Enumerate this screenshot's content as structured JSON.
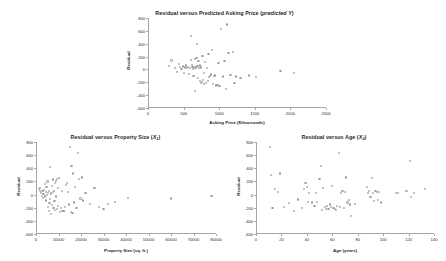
{
  "page": {
    "background": "#ffffff",
    "marker_color": "#9a9a9a",
    "axis_color": "#a6a6a6"
  },
  "charts": {
    "top": {
      "title_main": "Residual versus Predicted Asking Price (",
      "title_italic": "predicted Y",
      "title_close": ")",
      "xlabel": "Asking Price ($thousands)",
      "ylabel": "Residual",
      "xticks": [
        "0",
        "500",
        "1000",
        "1500",
        "2000",
        "2500"
      ],
      "yticks": [
        "800",
        "600",
        "400",
        "200",
        "0",
        "-200",
        "-400",
        "-600"
      ]
    },
    "bottom_left": {
      "title_pre": "Residual versus Property Size (",
      "title_var": "X",
      "title_sub": "1",
      "title_post": ")",
      "xlabel": "Property Size (sq. ft.)",
      "ylabel": "Residual",
      "xticks": [
        "0",
        "10000",
        "20000",
        "30000",
        "40000",
        "50000",
        "60000",
        "70000",
        "80000"
      ],
      "yticks": [
        "800",
        "600",
        "400",
        "200",
        "0",
        "-200",
        "-400",
        "-600"
      ]
    },
    "bottom_right": {
      "title_pre": "Residual versus Age (",
      "title_var": "X",
      "title_sub": "2",
      "title_post": ")",
      "xlabel": "Age (years)",
      "ylabel": "Residual",
      "xticks": [
        "0",
        "20",
        "40",
        "60",
        "80",
        "100",
        "120",
        "140"
      ],
      "yticks": [
        "800",
        "600",
        "400",
        "200",
        "0",
        "-200",
        "-400",
        "-600"
      ]
    }
  },
  "chart_data": [
    {
      "id": "residual-vs-predicted-price",
      "type": "scatter",
      "title": "Residual versus Predicted Asking Price (predicted Y)",
      "xlabel": "Asking Price ($thousands)",
      "ylabel": "Residual",
      "xlim": [
        0,
        2500
      ],
      "ylim": [
        -600,
        800
      ],
      "xticks": [
        0,
        500,
        1000,
        1500,
        2000,
        2500
      ],
      "yticks": [
        -600,
        -400,
        -200,
        0,
        200,
        400,
        600,
        800
      ],
      "grid": false,
      "legend": "none",
      "points": [
        [
          290,
          55
        ],
        [
          330,
          140
        ],
        [
          380,
          20
        ],
        [
          410,
          -40
        ],
        [
          430,
          90
        ],
        [
          455,
          35
        ],
        [
          470,
          10
        ],
        [
          490,
          45
        ],
        [
          500,
          -60
        ],
        [
          515,
          30
        ],
        [
          530,
          60
        ],
        [
          545,
          20
        ],
        [
          560,
          35
        ],
        [
          575,
          -75
        ],
        [
          585,
          25
        ],
        [
          600,
          150
        ],
        [
          605,
          520
        ],
        [
          615,
          65
        ],
        [
          625,
          40
        ],
        [
          635,
          10
        ],
        [
          640,
          -100
        ],
        [
          645,
          35
        ],
        [
          655,
          20
        ],
        [
          660,
          160
        ],
        [
          665,
          -330
        ],
        [
          672,
          30
        ],
        [
          680,
          180
        ],
        [
          688,
          400
        ],
        [
          695,
          55
        ],
        [
          700,
          -135
        ],
        [
          710,
          130
        ],
        [
          718,
          25
        ],
        [
          725,
          -185
        ],
        [
          735,
          60
        ],
        [
          742,
          -215
        ],
        [
          750,
          30
        ],
        [
          758,
          -200
        ],
        [
          765,
          210
        ],
        [
          775,
          -160
        ],
        [
          782,
          -60
        ],
        [
          790,
          -230
        ],
        [
          800,
          120
        ],
        [
          812,
          -205
        ],
        [
          825,
          20
        ],
        [
          838,
          -175
        ],
        [
          850,
          240
        ],
        [
          862,
          -120
        ],
        [
          875,
          -105
        ],
        [
          888,
          -80
        ],
        [
          900,
          300
        ],
        [
          915,
          -230
        ],
        [
          930,
          -100
        ],
        [
          945,
          -95
        ],
        [
          960,
          -250
        ],
        [
          975,
          -245
        ],
        [
          990,
          105
        ],
        [
          1005,
          -255
        ],
        [
          1030,
          625
        ],
        [
          1050,
          -110
        ],
        [
          1075,
          130
        ],
        [
          1095,
          -300
        ],
        [
          1110,
          700
        ],
        [
          1130,
          250
        ],
        [
          1160,
          -90
        ],
        [
          1190,
          270
        ],
        [
          1215,
          -205
        ],
        [
          1240,
          -110
        ],
        [
          1300,
          -130
        ],
        [
          1420,
          -95
        ],
        [
          1520,
          -115
        ],
        [
          1860,
          -30
        ],
        [
          2055,
          -60
        ]
      ]
    },
    {
      "id": "residual-vs-property-size",
      "type": "scatter",
      "title": "Residual versus Property Size (X1)",
      "xlabel": "Property Size (sq. ft.)",
      "ylabel": "Residual",
      "xlim": [
        0,
        80000
      ],
      "ylim": [
        -600,
        800
      ],
      "xticks": [
        0,
        10000,
        20000,
        30000,
        40000,
        50000,
        60000,
        70000,
        80000
      ],
      "yticks": [
        -600,
        -400,
        -200,
        0,
        200,
        400,
        600,
        800
      ],
      "grid": false,
      "legend": "none",
      "points": [
        [
          1200,
          90
        ],
        [
          1600,
          60
        ],
        [
          1900,
          105
        ],
        [
          2200,
          30
        ],
        [
          2600,
          -20
        ],
        [
          2900,
          50
        ],
        [
          3100,
          -55
        ],
        [
          3300,
          10
        ],
        [
          3600,
          70
        ],
        [
          3900,
          -30
        ],
        [
          4100,
          160
        ],
        [
          4300,
          35
        ],
        [
          4500,
          -90
        ],
        [
          4700,
          120
        ],
        [
          4900,
          -5
        ],
        [
          5100,
          200
        ],
        [
          5200,
          -190
        ],
        [
          5400,
          25
        ],
        [
          5600,
          -250
        ],
        [
          5800,
          60
        ],
        [
          6000,
          -130
        ],
        [
          6200,
          420
        ],
        [
          6400,
          -70
        ],
        [
          6600,
          15
        ],
        [
          6800,
          -300
        ],
        [
          7000,
          130
        ],
        [
          7200,
          -160
        ],
        [
          7400,
          35
        ],
        [
          7600,
          230
        ],
        [
          7800,
          -205
        ],
        [
          8000,
          55
        ],
        [
          8200,
          -100
        ],
        [
          8400,
          170
        ],
        [
          8600,
          -240
        ],
        [
          8800,
          210
        ],
        [
          9000,
          -30
        ],
        [
          9200,
          240
        ],
        [
          9400,
          -215
        ],
        [
          9600,
          95
        ],
        [
          9800,
          -180
        ],
        [
          10200,
          250
        ],
        [
          10600,
          -260
        ],
        [
          11000,
          -200
        ],
        [
          11400,
          60
        ],
        [
          11800,
          -245
        ],
        [
          12200,
          -250
        ],
        [
          12600,
          -255
        ],
        [
          13000,
          -185
        ],
        [
          13400,
          140
        ],
        [
          13800,
          180
        ],
        [
          14200,
          40
        ],
        [
          14600,
          -150
        ],
        [
          15000,
          730
        ],
        [
          15400,
          -265
        ],
        [
          15800,
          440
        ],
        [
          16200,
          -275
        ],
        [
          16600,
          320
        ],
        [
          17000,
          -120
        ],
        [
          17400,
          110
        ],
        [
          18000,
          -210
        ],
        [
          18600,
          630
        ],
        [
          19200,
          240
        ],
        [
          19800,
          -60
        ],
        [
          20400,
          260
        ],
        [
          21000,
          -90
        ],
        [
          22000,
          20
        ],
        [
          24000,
          -145
        ],
        [
          26000,
          100
        ],
        [
          28000,
          -195
        ],
        [
          30000,
          -220
        ],
        [
          32000,
          -140
        ],
        [
          35000,
          -110
        ],
        [
          41000,
          -50
        ],
        [
          60000,
          -60
        ],
        [
          78000,
          -25
        ]
      ]
    },
    {
      "id": "residual-vs-age",
      "type": "scatter",
      "title": "Residual versus Age (X2)",
      "xlabel": "Age (years)",
      "ylabel": "Residual",
      "xlim": [
        0,
        140
      ],
      "ylim": [
        -600,
        800
      ],
      "xticks": [
        0,
        20,
        40,
        60,
        80,
        100,
        120,
        140
      ],
      "yticks": [
        -600,
        -400,
        -200,
        0,
        200,
        400,
        600,
        800
      ],
      "grid": false,
      "legend": "none",
      "points": [
        [
          11,
          730
        ],
        [
          12,
          300
        ],
        [
          13,
          -205
        ],
        [
          15,
          80
        ],
        [
          17,
          40
        ],
        [
          19,
          320
        ],
        [
          22,
          -195
        ],
        [
          26,
          -130
        ],
        [
          30,
          -250
        ],
        [
          33,
          -75
        ],
        [
          36,
          -210
        ],
        [
          38,
          90
        ],
        [
          39,
          170
        ],
        [
          40,
          120
        ],
        [
          41,
          -110
        ],
        [
          42,
          25
        ],
        [
          44,
          -120
        ],
        [
          46,
          -175
        ],
        [
          47,
          30
        ],
        [
          48,
          -115
        ],
        [
          50,
          240
        ],
        [
          51,
          440
        ],
        [
          52,
          -230
        ],
        [
          53,
          105
        ],
        [
          54,
          -195
        ],
        [
          55,
          -215
        ],
        [
          56,
          -180
        ],
        [
          57,
          -225
        ],
        [
          58,
          -150
        ],
        [
          59,
          -190
        ],
        [
          60,
          130
        ],
        [
          61,
          -200
        ],
        [
          62,
          -215
        ],
        [
          63,
          -240
        ],
        [
          64,
          -175
        ],
        [
          65,
          630
        ],
        [
          66,
          -185
        ],
        [
          67,
          20
        ],
        [
          68,
          60
        ],
        [
          69,
          -205
        ],
        [
          70,
          40
        ],
        [
          71,
          260
        ],
        [
          72,
          -120
        ],
        [
          73,
          -85
        ],
        [
          74,
          -150
        ],
        [
          75,
          -330
        ],
        [
          78,
          -140
        ],
        [
          87,
          120
        ],
        [
          88,
          30
        ],
        [
          89,
          55
        ],
        [
          90,
          -40
        ],
        [
          91,
          255
        ],
        [
          92,
          20
        ],
        [
          93,
          -100
        ],
        [
          94,
          60
        ],
        [
          95,
          35
        ],
        [
          96,
          -80
        ],
        [
          97,
          45
        ],
        [
          98,
          -120
        ],
        [
          110,
          20
        ],
        [
          112,
          25
        ],
        [
          118,
          60
        ],
        [
          119,
          55
        ],
        [
          121,
          515
        ],
        [
          122,
          -35
        ],
        [
          124,
          30
        ],
        [
          133,
          90
        ]
      ]
    }
  ]
}
